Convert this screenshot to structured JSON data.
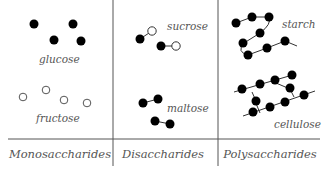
{
  "diagram": {
    "colors": {
      "line": "#555555",
      "dot_fill": "#000000",
      "hollow_fill": "#ffffff",
      "text": "#555555"
    },
    "categories": [
      {
        "id": "mono",
        "label": "Monosaccharides",
        "molecules": [
          "glucose",
          "fructose"
        ]
      },
      {
        "id": "di",
        "label": "Disaccharides",
        "molecules": [
          "sucrose",
          "maltose"
        ]
      },
      {
        "id": "poly",
        "label": "Polysaccharides",
        "molecules": [
          "starch",
          "cellulose"
        ]
      }
    ],
    "molecules": {
      "glucose": "glucose",
      "fructose": "fructose",
      "sucrose": "sucrose",
      "maltose": "maltose",
      "starch": "starch",
      "cellulose": "cellulose"
    }
  }
}
